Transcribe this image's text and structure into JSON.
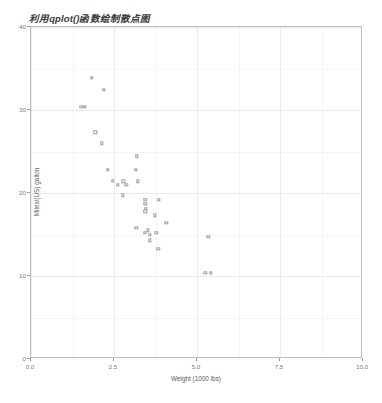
{
  "chart_data": {
    "type": "scatter",
    "title": "利用qplot()函数绘制散点图",
    "xlabel": "Weight (1000 lbs)",
    "ylabel": "Miles/(US) gallon",
    "xlim": [
      0.0,
      10.0
    ],
    "ylim": [
      0,
      40
    ],
    "xticks": [
      "0.0",
      "2.5",
      "5.0",
      "7.5",
      "10.0"
    ],
    "xtick_values": [
      0.0,
      2.5,
      5.0,
      7.5,
      10.0
    ],
    "yticks": [
      "0",
      "10",
      "20",
      "30",
      "40"
    ],
    "ytick_values": [
      0,
      10,
      20,
      30,
      40
    ],
    "xminor_values": [
      1.25,
      3.75,
      6.25,
      8.75
    ],
    "yminor_values": [
      5,
      15,
      25,
      35
    ],
    "grid": true,
    "legend": "none",
    "point_shape": "open-square",
    "point_color": "#9e9e9e",
    "panel_background": "#ffffff",
    "panel_border_color": "#bdbdbd",
    "gridline_color": "#eaeaea",
    "n_points": 32,
    "series": [
      {
        "name": "mtcars",
        "x": [
          2.62,
          2.875,
          2.32,
          3.215,
          3.44,
          3.46,
          3.57,
          3.19,
          3.15,
          3.44,
          3.44,
          4.07,
          3.73,
          3.78,
          5.25,
          5.424,
          5.345,
          2.2,
          1.615,
          1.835,
          2.465,
          3.52,
          3.435,
          3.84,
          3.845,
          1.935,
          2.14,
          1.513,
          3.17,
          2.77,
          3.57,
          2.78
        ],
        "y": [
          21.0,
          21.0,
          22.8,
          21.4,
          18.7,
          18.1,
          14.3,
          24.4,
          22.8,
          19.2,
          17.8,
          16.4,
          17.3,
          15.2,
          10.4,
          10.4,
          14.7,
          32.4,
          30.4,
          33.9,
          21.5,
          15.5,
          15.2,
          13.3,
          19.2,
          27.3,
          26.0,
          30.4,
          15.8,
          19.7,
          15.0,
          21.4
        ]
      }
    ]
  }
}
